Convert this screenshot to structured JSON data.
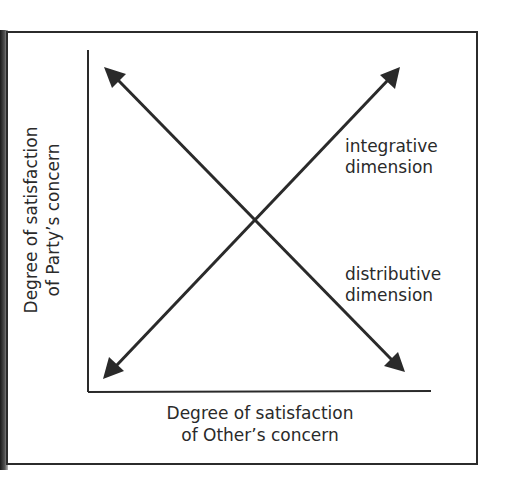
{
  "diagram": {
    "y_axis_label": {
      "line1": "Degree of satisfaction",
      "line2": "of Party’s concern"
    },
    "x_axis_label": {
      "line1": "Degree of satisfaction",
      "line2": "of Other’s concern"
    },
    "integrative_label": {
      "line1": "integrative",
      "line2": "dimension"
    },
    "distributive_label": {
      "line1": "distributive",
      "line2": "dimension"
    },
    "colors": {
      "ink": "#2a2a2a",
      "background": "#ffffff"
    }
  }
}
